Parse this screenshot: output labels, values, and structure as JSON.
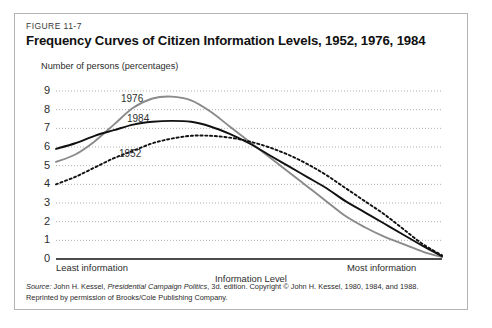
{
  "figure": {
    "number": "FIGURE 11-7",
    "title": "Frequency Curves of Citizen Information Levels, 1952, 1976, 1984"
  },
  "source": {
    "label": "Source:",
    "author": "John H. Kessel,",
    "work": "Presidential Campaign Politics",
    "rest": ", 3d. edition. Copyright © John H. Kessel, 1980, 1984, and 1988.",
    "line2": "Reprinted by permission of Brooks/Cole Publishing Company."
  },
  "colors": {
    "frame_border": "#b4b4b4",
    "axis": "#111111",
    "gridline": "#9a9a9a",
    "series_1976": "#8a8a8a",
    "series_1984": "#111111",
    "series_1952": "#111111",
    "background": "#ffffff"
  },
  "chart_data": {
    "type": "line",
    "title": "Frequency Curves of Citizen Information Levels, 1952, 1976, 1984",
    "xlabel": "Information Level",
    "ylabel": "Number of persons (percentages)",
    "x_axis_caption_left": "Least information",
    "x_axis_caption_right": "Most information",
    "ylim": [
      0,
      9
    ],
    "yticks": [
      0,
      1,
      2,
      3,
      4,
      5,
      6,
      7,
      8,
      9
    ],
    "ytick_labels": [
      "0",
      "1",
      "2",
      "3",
      "4",
      "5",
      "6",
      "7",
      "8",
      "9"
    ],
    "xlim": [
      0,
      100
    ],
    "xticks": [],
    "grid": true,
    "grid_axis": "y",
    "legend": "inline-labels",
    "x": [
      0,
      5,
      10,
      15,
      20,
      25,
      30,
      35,
      40,
      45,
      50,
      55,
      60,
      65,
      70,
      75,
      80,
      85,
      90,
      95,
      100
    ],
    "series": [
      {
        "name": "1976",
        "label": "1976",
        "color": "#8a8a8a",
        "style": "solid",
        "values": [
          5.2,
          5.6,
          6.3,
          7.2,
          8.1,
          8.6,
          8.7,
          8.5,
          7.9,
          7.1,
          6.3,
          5.5,
          4.7,
          3.9,
          3.1,
          2.3,
          1.7,
          1.2,
          0.8,
          0.4,
          0.1
        ]
      },
      {
        "name": "1984",
        "label": "1984",
        "color": "#111111",
        "style": "solid",
        "values": [
          5.9,
          6.2,
          6.6,
          6.9,
          7.2,
          7.35,
          7.4,
          7.35,
          7.1,
          6.7,
          6.2,
          5.6,
          5.0,
          4.4,
          3.8,
          3.1,
          2.5,
          1.9,
          1.3,
          0.7,
          0.15
        ]
      },
      {
        "name": "1952",
        "label": "1952",
        "color": "#111111",
        "style": "dotted",
        "values": [
          4.0,
          4.4,
          4.9,
          5.4,
          5.8,
          6.2,
          6.45,
          6.6,
          6.6,
          6.5,
          6.3,
          6.0,
          5.6,
          5.1,
          4.5,
          3.8,
          3.1,
          2.4,
          1.6,
          0.8,
          0.2
        ]
      }
    ],
    "series_label_positions": [
      {
        "name": "1976",
        "left": 106,
        "top": 79
      },
      {
        "name": "1984",
        "left": 112,
        "top": 99
      },
      {
        "name": "1952",
        "left": 104,
        "top": 134
      }
    ]
  }
}
